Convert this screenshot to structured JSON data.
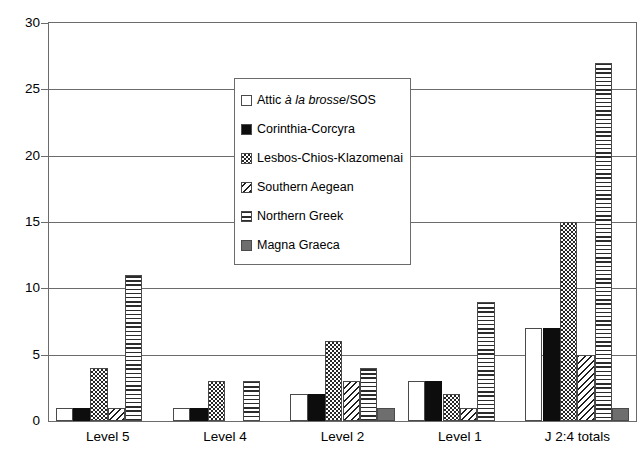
{
  "chart_data": {
    "type": "bar",
    "title": "",
    "subtitle": "",
    "xlabel": "",
    "ylabel": "",
    "ylim": [
      0,
      30
    ],
    "ytick_step": 5,
    "yticks": [
      0,
      5,
      10,
      15,
      20,
      25,
      30
    ],
    "ytick_labels": [
      "0",
      "5",
      "10",
      "15",
      "20",
      "25",
      "30"
    ],
    "grid": "horizontal",
    "legend_position": "upper-center",
    "categories": [
      "Level 5",
      "Level 4",
      "Level 2",
      "Level 1",
      "J 2:4 totals"
    ],
    "series": [
      {
        "name": "Attic à la brosse/SOS",
        "name_plain": "Attic a la brosse/SOS",
        "pattern": "white-empty",
        "values": [
          1,
          1,
          2,
          3,
          7
        ]
      },
      {
        "name": "Corinthia-Corcyra",
        "pattern": "solid-black",
        "values": [
          1,
          1,
          2,
          3,
          7
        ]
      },
      {
        "name": "Lesbos-Chios-Klazomenai",
        "pattern": "checkerboard",
        "values": [
          4,
          3,
          6,
          2,
          15
        ]
      },
      {
        "name": "Southern Aegean",
        "pattern": "diagonal-hatch",
        "values": [
          1,
          0,
          3,
          1,
          5
        ]
      },
      {
        "name": "Northern Greek",
        "pattern": "horizontal-stripes",
        "values": [
          11,
          3,
          4,
          9,
          27
        ]
      },
      {
        "name": "Magna Graeca",
        "pattern": "solid-gray",
        "values": [
          0,
          0,
          1,
          0,
          1
        ]
      }
    ]
  },
  "legend": {
    "items": [
      {
        "label_pre": "Attic ",
        "label_italic": "à la brosse",
        "label_post": "/SOS",
        "swatch": "white-empty"
      },
      {
        "label_pre": "Corinthia-Corcyra",
        "label_italic": "",
        "label_post": "",
        "swatch": "solid-black"
      },
      {
        "label_pre": "Lesbos-Chios-Klazomenai",
        "label_italic": "",
        "label_post": "",
        "swatch": "checkerboard"
      },
      {
        "label_pre": "Southern Aegean",
        "label_italic": "",
        "label_post": "",
        "swatch": "diagonal-hatch"
      },
      {
        "label_pre": "Northern Greek",
        "label_italic": "",
        "label_post": "",
        "swatch": "horizontal-stripes"
      },
      {
        "label_pre": "Magna Graeca",
        "label_italic": "",
        "label_post": "",
        "swatch": "solid-gray"
      }
    ]
  },
  "colors": {
    "axis": "#6b6b6b",
    "bar_outline": "#4a4a4a",
    "solid_black": "#0d0d0d",
    "solid_gray": "#6e6e6e",
    "background": "#ffffff"
  }
}
